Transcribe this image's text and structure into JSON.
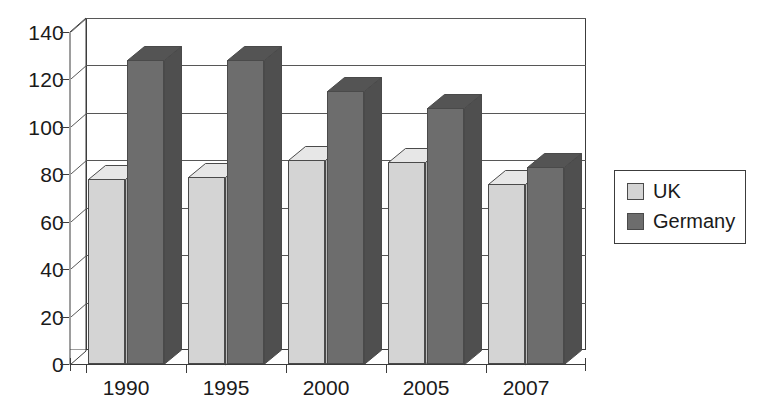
{
  "chart_data": {
    "type": "bar",
    "title": "",
    "subtitle": "",
    "xlabel": "",
    "ylabel": "",
    "categories": [
      "1990",
      "1995",
      "2000",
      "2005",
      "2007"
    ],
    "series": [
      {
        "name": "UK",
        "values": [
          78,
          79,
          86,
          85,
          76
        ],
        "color": "#d4d4d4"
      },
      {
        "name": "Germany",
        "values": [
          128,
          128,
          115,
          108,
          83
        ],
        "color": "#6d6d6d"
      }
    ],
    "ylim": [
      0,
      140
    ],
    "ytick_values": [
      0,
      20,
      40,
      60,
      80,
      100,
      120,
      140
    ],
    "ytick_labels": [
      "0",
      "20",
      "40",
      "60",
      "80",
      "100",
      "120",
      "140"
    ],
    "grid": true,
    "grid_axis": "y",
    "legend": {
      "position": "right",
      "entries": [
        {
          "label": "UK",
          "color": "#d4d4d4"
        },
        {
          "label": "Germany",
          "color": "#6d6d6d"
        }
      ]
    },
    "style": "3d-column",
    "background": "#ffffff",
    "axis_color": "#3c3c3c",
    "grid_color": "#575757",
    "text_color": "#1a1a1a"
  }
}
